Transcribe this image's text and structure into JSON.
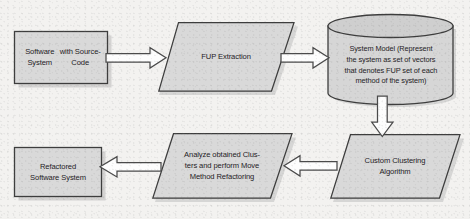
{
  "diagram": {
    "background_color": "#f3f2f0",
    "shape_fill": "#d9d9d9",
    "shape_fill_dark": "#cfcfcf",
    "shape_stroke": "#3f3f3f",
    "arrow_fill": "#ffffff",
    "arrow_stroke": "#4a4a4a",
    "text_color": "#24211f"
  },
  "nodes": [
    {
      "id": "software-system",
      "shape": "rectangle",
      "label_lines": [
        "Software System",
        "with Source-Code"
      ],
      "label": "Software System with Source-Code"
    },
    {
      "id": "fup-extraction",
      "shape": "parallelogram",
      "label_lines": [
        "FUP Extraction"
      ],
      "label": "FUP Extraction"
    },
    {
      "id": "system-model",
      "shape": "cylinder",
      "label_lines": [
        "System Model (Represent",
        "the system as set of vectors",
        "that denotes FUP set of each",
        "method of the system)"
      ],
      "label": "System Model (Represent the system as set of vectors that denotes FUP set of each method of the system)"
    },
    {
      "id": "custom-clustering",
      "shape": "parallelogram",
      "label_lines": [
        "Custom Clustering",
        "Algorithm"
      ],
      "label": "Custom Clustering Algorithm"
    },
    {
      "id": "analyze-clusters",
      "shape": "parallelogram",
      "label_lines": [
        "Analyze obtained Clus-",
        "ters and perform Move",
        "Method Refactoring"
      ],
      "label": "Analyze obtained Clusters and perform Move Method Refactoring"
    },
    {
      "id": "refactored-system",
      "shape": "rectangle",
      "label_lines": [
        "Refactored",
        "Software System"
      ],
      "label": "Refactored Software System"
    }
  ],
  "arrows": [
    {
      "id": "arrow-1",
      "from": "software-system",
      "to": "fup-extraction",
      "direction": "right"
    },
    {
      "id": "arrow-2",
      "from": "fup-extraction",
      "to": "system-model",
      "direction": "right"
    },
    {
      "id": "arrow-3",
      "from": "system-model",
      "to": "custom-clustering",
      "direction": "down"
    },
    {
      "id": "arrow-4",
      "from": "custom-clustering",
      "to": "analyze-clusters",
      "direction": "left"
    },
    {
      "id": "arrow-5",
      "from": "analyze-clusters",
      "to": "refactored-system",
      "direction": "left"
    }
  ]
}
